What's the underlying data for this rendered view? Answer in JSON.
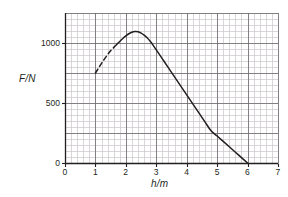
{
  "chart_data": {
    "type": "line",
    "title": "",
    "xlabel": "h/m",
    "ylabel": "F/N",
    "xlim": [
      0,
      7
    ],
    "ylim": [
      0,
      1250
    ],
    "grid": true,
    "grid_major_x": 1,
    "grid_minor_x": 0.2,
    "grid_major_y": 250,
    "grid_minor_y": 50,
    "xticks": [
      0,
      1,
      2,
      3,
      4,
      5,
      6,
      7
    ],
    "xtick_labels": [
      "0",
      "1",
      "2",
      "3",
      "4",
      "5",
      "6",
      "7"
    ],
    "yticks": [
      0,
      500,
      1000
    ],
    "ytick_labels": [
      "0",
      "500",
      "1000"
    ],
    "legend": null,
    "series": [
      {
        "name": "extrapolated-rise",
        "style": "dashed",
        "color": "#231f20",
        "points": [
          {
            "x": 1.0,
            "y": 750
          },
          {
            "x": 1.1,
            "y": 790
          },
          {
            "x": 1.2,
            "y": 830
          },
          {
            "x": 1.3,
            "y": 868
          },
          {
            "x": 1.4,
            "y": 903
          },
          {
            "x": 1.5,
            "y": 935
          },
          {
            "x": 1.6,
            "y": 962
          }
        ]
      },
      {
        "name": "measured-curve",
        "style": "solid",
        "color": "#231f20",
        "points": [
          {
            "x": 1.6,
            "y": 962
          },
          {
            "x": 1.7,
            "y": 988
          },
          {
            "x": 1.8,
            "y": 1013
          },
          {
            "x": 1.9,
            "y": 1038
          },
          {
            "x": 2.0,
            "y": 1060
          },
          {
            "x": 2.1,
            "y": 1077
          },
          {
            "x": 2.2,
            "y": 1090
          },
          {
            "x": 2.3,
            "y": 1095
          },
          {
            "x": 2.4,
            "y": 1093
          },
          {
            "x": 2.5,
            "y": 1083
          },
          {
            "x": 2.6,
            "y": 1066
          },
          {
            "x": 2.7,
            "y": 1043
          },
          {
            "x": 2.8,
            "y": 1014
          },
          {
            "x": 2.9,
            "y": 980
          },
          {
            "x": 3.0,
            "y": 943
          },
          {
            "x": 3.2,
            "y": 868
          },
          {
            "x": 3.4,
            "y": 793
          },
          {
            "x": 3.6,
            "y": 718
          },
          {
            "x": 3.8,
            "y": 643
          },
          {
            "x": 4.0,
            "y": 568
          },
          {
            "x": 4.2,
            "y": 493
          },
          {
            "x": 4.4,
            "y": 418
          },
          {
            "x": 4.6,
            "y": 343
          },
          {
            "x": 4.8,
            "y": 268
          },
          {
            "x": 5.0,
            "y": 225
          },
          {
            "x": 5.2,
            "y": 180
          },
          {
            "x": 5.4,
            "y": 135
          },
          {
            "x": 5.6,
            "y": 90
          },
          {
            "x": 5.8,
            "y": 45
          },
          {
            "x": 6.0,
            "y": 0
          }
        ]
      }
    ],
    "annotations": {
      "peak_value": 1095,
      "peak_position": 2.3,
      "zero_crossing": 6.0,
      "dashed_start": {
        "x": 1.0,
        "y": 750
      }
    },
    "colors": {
      "grid_minor": "#c8c5c8",
      "grid_major": "#6d6a6d",
      "axis": "#231f20",
      "curve": "#231f20",
      "background": "#ffffff"
    }
  }
}
